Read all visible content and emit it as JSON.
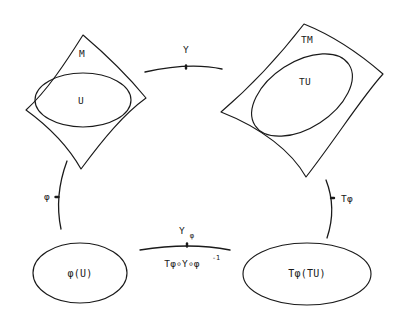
{
  "diagram": {
    "type": "commutative-diagram",
    "background_color": "#ffffff",
    "stroke_color": "#1a1a1a",
    "nodes": [
      {
        "id": "manifold-m",
        "shape": "curved-quadrilateral",
        "label": "M",
        "position": "top-left"
      },
      {
        "id": "open-set-u",
        "shape": "ellipse",
        "label": "U",
        "position": "inside-manifold-m"
      },
      {
        "id": "tangent-bundle-tm",
        "shape": "curved-quadrilateral",
        "label": "TM",
        "position": "top-right"
      },
      {
        "id": "tangent-set-tu",
        "shape": "ellipse",
        "label": "TU",
        "position": "inside-tangent-bundle-tm"
      },
      {
        "id": "chart-image-phi-u",
        "shape": "ellipse",
        "label": "φ(U)",
        "position": "bottom-left"
      },
      {
        "id": "chart-image-tphi-tu",
        "shape": "ellipse",
        "label": "Tφ(TU)",
        "position": "bottom-right"
      }
    ],
    "arrows": [
      {
        "id": "arrow-top",
        "label": "Y",
        "from": "manifold-m",
        "to": "tangent-bundle-tm",
        "orientation": "horizontal-top"
      },
      {
        "id": "arrow-left",
        "label": "φ",
        "from": "manifold-m",
        "to": "chart-image-phi-u",
        "orientation": "vertical-left"
      },
      {
        "id": "arrow-right",
        "label": "Tφ",
        "from": "tangent-bundle-tm",
        "to": "chart-image-tphi-tu",
        "orientation": "vertical-right"
      },
      {
        "id": "arrow-bottom",
        "label_main": "Y",
        "label_subscript": "φ",
        "label_below_base": "Tφ∘Y∘φ",
        "label_below_exponent": "-1",
        "from": "chart-image-phi-u",
        "to": "chart-image-tphi-tu",
        "orientation": "horizontal-bottom"
      }
    ]
  }
}
